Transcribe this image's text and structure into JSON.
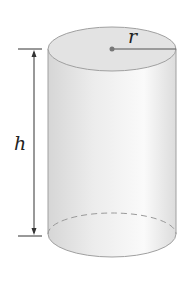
{
  "diagram": {
    "labels": {
      "height": "h",
      "radius": "r"
    },
    "colors": {
      "body_light": "#f7f7f7",
      "body_dark": "#d8d8d8",
      "top": "#e2e2e2",
      "outline": "#9a9a9a",
      "line": "#333333"
    }
  }
}
